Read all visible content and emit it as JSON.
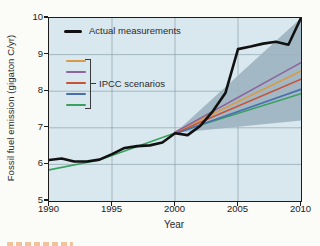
{
  "figure": {
    "xlabel": "Year",
    "ylabel": "Fossil fuel emission (gigaton C/yr)",
    "legend": {
      "actual_label": "Actual measurements",
      "scenarios_label": "IPCC scenarios",
      "scenario_swatches": [
        {
          "name": "scenario-orange",
          "color": "#d89b4a"
        },
        {
          "name": "scenario-purple",
          "color": "#8d659e"
        },
        {
          "name": "scenario-red",
          "color": "#c85238"
        },
        {
          "name": "scenario-blue",
          "color": "#4a6fae"
        },
        {
          "name": "scenario-green",
          "color": "#3aa060"
        }
      ]
    },
    "colors": {
      "plot_background": "#d9e7ee",
      "uncertainty_band": "#9cb2c0",
      "gridline": "rgba(120,145,158,0.55)",
      "axis": "#1c1c1c",
      "actual_line": "#111111"
    }
  },
  "chart_data": {
    "type": "line",
    "title": "",
    "xlabel": "Year",
    "ylabel": "Fossil fuel emission (gigaton C/yr)",
    "xlim": [
      1990,
      2010
    ],
    "ylim": [
      5,
      10
    ],
    "x_ticks": [
      1990,
      1995,
      2000,
      2005,
      2010
    ],
    "y_ticks": [
      5,
      6,
      7,
      8,
      9,
      10
    ],
    "grid": true,
    "legend_position": "top-left",
    "band": {
      "name": "ipcc-scenario-uncertainty-range",
      "color": "#9cb2c0",
      "opacity": 0.9,
      "polygon": [
        [
          2000,
          6.86
        ],
        [
          2010,
          10.0
        ],
        [
          2010,
          7.2
        ]
      ]
    },
    "series": [
      {
        "name": "Actual measurements",
        "color": "#111111",
        "width": 2.6,
        "x": [
          1990,
          1991,
          1992,
          1993,
          1994,
          1995,
          1996,
          1997,
          1998,
          1999,
          2000,
          2001,
          2002,
          2003,
          2004,
          2005,
          2006,
          2007,
          2008,
          2009,
          2010
        ],
        "y": [
          6.12,
          6.16,
          6.08,
          6.08,
          6.13,
          6.28,
          6.45,
          6.5,
          6.52,
          6.6,
          6.85,
          6.8,
          7.05,
          7.45,
          7.95,
          9.15,
          9.22,
          9.3,
          9.35,
          9.27,
          10.0
        ]
      },
      {
        "name": "IPCC scenario purple",
        "color": "#8d659e",
        "width": 1.6,
        "x": [
          2000,
          2010
        ],
        "y": [
          6.88,
          8.78
        ]
      },
      {
        "name": "IPCC scenario orange",
        "color": "#d89b4a",
        "width": 1.6,
        "x": [
          2000,
          2010
        ],
        "y": [
          6.88,
          8.55
        ]
      },
      {
        "name": "IPCC scenario red",
        "color": "#c85238",
        "width": 1.6,
        "x": [
          2000,
          2010
        ],
        "y": [
          6.86,
          8.33
        ]
      },
      {
        "name": "IPCC scenario blue",
        "color": "#4a6fae",
        "width": 1.6,
        "x": [
          2000,
          2010
        ],
        "y": [
          6.84,
          8.05
        ]
      },
      {
        "name": "IPCC scenario green",
        "color": "#3aa060",
        "width": 1.6,
        "x": [
          1990,
          1994,
          2000,
          2010
        ],
        "y": [
          5.85,
          6.12,
          6.86,
          7.93
        ]
      }
    ]
  }
}
